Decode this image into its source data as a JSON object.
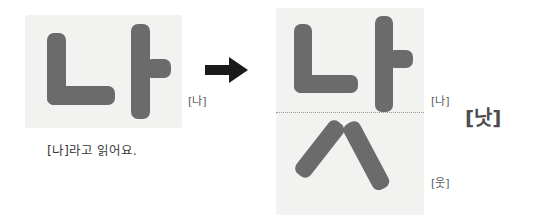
{
  "figure": {
    "type": "hangul-syllable-decomposition",
    "source_syllable": "나",
    "result_syllable": "낫",
    "final_consonant": "ㅅ"
  },
  "left": {
    "panel_name": "syllable-na-panel",
    "glyph_text": "나",
    "label": "[나]",
    "caption": "[나]라고 읽어요."
  },
  "arrow": {
    "icon": "right-arrow-icon"
  },
  "right": {
    "panel_name": "syllable-nat-panel",
    "top_glyph_text": "나",
    "bottom_glyph_text": "ㅅ",
    "label_top": "[나]",
    "label_bottom": "[웃]",
    "label_result": "[낫]"
  },
  "colors": {
    "panel_background": "#f2f2f0",
    "stroke": "#6b6b6b",
    "label_text": "#595959",
    "caption_text": "#3a3a3a",
    "arrow": "#1a1a1a",
    "divider": "#9a9a9a",
    "page_background": "#ffffff"
  }
}
